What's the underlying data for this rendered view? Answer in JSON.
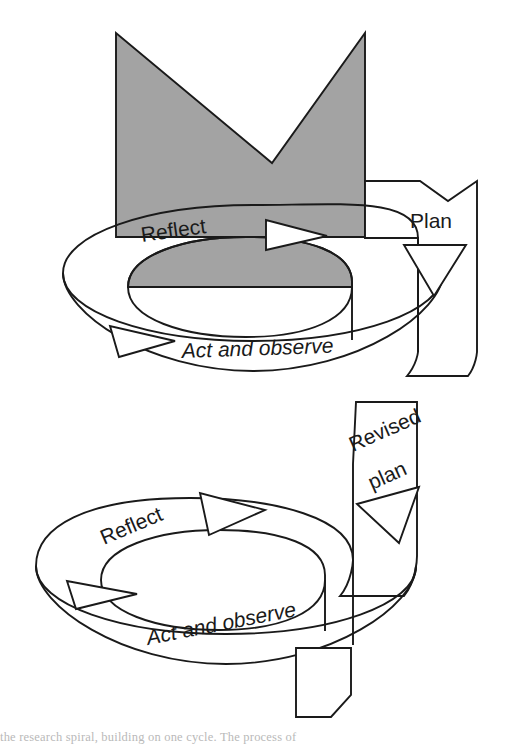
{
  "figure": {
    "background_color": "#ffffff",
    "line_color": "#1a1a1a",
    "shade_color": "#a3a3a3"
  },
  "cycles": [
    {
      "id": "cycle-1",
      "entry_label": "Plan",
      "steps": [
        {
          "name": "reflect",
          "label": "Reflect",
          "style": "plain"
        },
        {
          "name": "act-and-observe",
          "label": "Act and observe",
          "style": "italic"
        }
      ]
    },
    {
      "id": "cycle-2",
      "entry_label": "Revised plan",
      "entry_label_line1": "Revised",
      "entry_label_line2": "plan",
      "steps": [
        {
          "name": "reflect",
          "label": "Reflect",
          "style": "plain"
        },
        {
          "name": "act-and-observe",
          "label": "Act and observe",
          "style": "italic"
        }
      ]
    }
  ],
  "labels": {
    "plan": "Plan",
    "revised_line1": "Revised",
    "revised_line2": "plan",
    "reflect_top": "Reflect",
    "act_observe_top": "Act and observe",
    "reflect_bottom": "Reflect",
    "act_observe_bottom": "Act and observe"
  },
  "caption": {
    "text": "the research spiral, building on one cycle. The process of"
  }
}
